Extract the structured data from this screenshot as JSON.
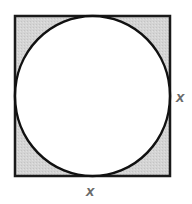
{
  "diagram": {
    "square": {
      "x": 15,
      "y": 16,
      "size": 155,
      "fill": "#d6d6d6",
      "stroke": "#1a1a1a",
      "stroke_width": 2.5
    },
    "circle": {
      "cx": 92.5,
      "cy": 93.5,
      "r": 77.5,
      "fill": "#ffffff",
      "stroke": "#111111",
      "stroke_width": 2.5
    },
    "labels": {
      "right_side": "x",
      "bottom_side": "x"
    },
    "label_color": "#6a6a6a"
  }
}
